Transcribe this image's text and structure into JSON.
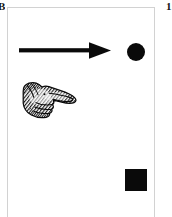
{
  "figure": {
    "background_color": "#ffffff",
    "ink_color": "#0a0a0a",
    "border_color": "#d2d2d2",
    "labels": {
      "top_left": "B",
      "top_right": "1"
    },
    "marks": [
      {
        "id": "arrow",
        "name": "right-pointing-arrow",
        "shape": "arrow",
        "direction": "right",
        "color": "#0a0a0a",
        "x": 11,
        "y": 33,
        "width": 94,
        "height": 20
      },
      {
        "id": "circle",
        "name": "filled-circle",
        "shape": "circle",
        "color": "#0a0a0a",
        "x": 119,
        "y": 35,
        "width": 18,
        "height": 18
      },
      {
        "id": "hand",
        "name": "pointing-hand-manicule",
        "shape": "engraved-hand",
        "direction": "right",
        "color": "#0a0a0a",
        "x": 12,
        "y": 69,
        "width": 58,
        "height": 46
      },
      {
        "id": "square",
        "name": "filled-square",
        "shape": "square",
        "color": "#0a0a0a",
        "x": 117,
        "y": 161,
        "width": 22,
        "height": 22
      }
    ]
  }
}
